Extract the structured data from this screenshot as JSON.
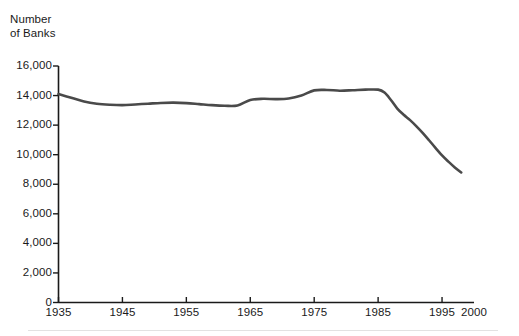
{
  "axis_title_line1": "Number",
  "axis_title_line2": "of Banks",
  "y_axis": {
    "labels": [
      "16,000",
      "14,000",
      "12,000",
      "10,000",
      "8,000",
      "6,000",
      "4,000",
      "2,000",
      "0"
    ],
    "values": [
      16000,
      14000,
      12000,
      10000,
      8000,
      6000,
      4000,
      2000,
      0
    ]
  },
  "x_axis": {
    "labels": [
      "1935",
      "1945",
      "1955",
      "1965",
      "1975",
      "1985",
      "1995",
      "2000"
    ],
    "values": [
      1935,
      1945,
      1955,
      1965,
      1975,
      1985,
      1995,
      2000
    ]
  },
  "colors": {
    "line": "#4a4a4a",
    "axis": "#1a1a1a",
    "text": "#1a1a1a",
    "background": "#ffffff",
    "footer_rule": "#e2e2e2"
  },
  "chart_data": {
    "type": "line",
    "title": "",
    "subtitle": "",
    "xlabel": "",
    "ylabel": "Number of Banks",
    "xlim": [
      1935,
      2000
    ],
    "ylim": [
      0,
      16000
    ],
    "grid": false,
    "legend": false,
    "legend_position": "none",
    "x_tick_labels": [
      "1935",
      "1945",
      "1955",
      "1965",
      "1975",
      "1985",
      "1995",
      "2000"
    ],
    "y_tick_labels": [
      "0",
      "2,000",
      "4,000",
      "6,000",
      "8,000",
      "10,000",
      "12,000",
      "14,000",
      "16,000"
    ],
    "series": [
      {
        "name": "Number of Banks",
        "color": "#4a4a4a",
        "x": [
          1935,
          1937,
          1939,
          1941,
          1943,
          1945,
          1947,
          1949,
          1951,
          1953,
          1955,
          1957,
          1959,
          1961,
          1963,
          1965,
          1967,
          1969,
          1971,
          1973,
          1975,
          1977,
          1979,
          1981,
          1983,
          1985,
          1986,
          1987,
          1988,
          1989,
          1990,
          1991,
          1992,
          1993,
          1994,
          1995,
          1996,
          1997,
          1998
        ],
        "y": [
          14100,
          13850,
          13600,
          13450,
          13380,
          13350,
          13400,
          13450,
          13500,
          13520,
          13490,
          13420,
          13350,
          13310,
          13330,
          13700,
          13780,
          13760,
          13800,
          14000,
          14350,
          14380,
          14330,
          14360,
          14400,
          14400,
          14200,
          13700,
          13120,
          12700,
          12340,
          11920,
          11460,
          10960,
          10450,
          9950,
          9530,
          9140,
          8800
        ]
      }
    ]
  }
}
